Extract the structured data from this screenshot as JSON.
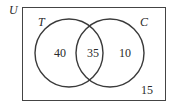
{
  "diagram": {
    "type": "venn",
    "universe_label": "U",
    "sets": [
      {
        "label": "T",
        "only_count": "40"
      },
      {
        "label": "C",
        "only_count": "10"
      }
    ],
    "intersection_count": "35",
    "outside_count": "15",
    "colors": {
      "stroke": "#3a3a3a",
      "text": "#2a2a2a",
      "background": "#ffffff"
    }
  }
}
